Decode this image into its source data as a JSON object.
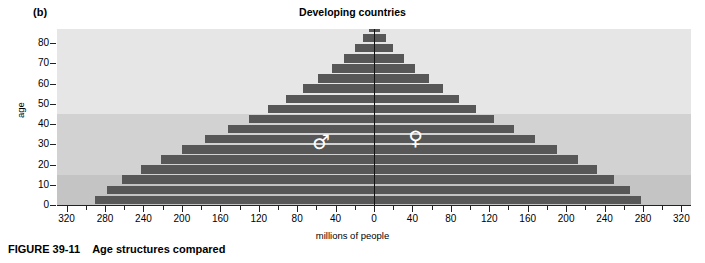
{
  "panel": {
    "label": "(b)"
  },
  "caption": {
    "figure_number": "FIGURE 39-11",
    "text": "Age structures compared"
  },
  "colors": {
    "bar": "#575757",
    "band_top": "#e6e6e6",
    "band_mid": "#d2d2d2",
    "band_bottom": "#c4c4c4",
    "axis": "#111111",
    "glyph": "#ffffff"
  },
  "glyphs": {
    "male": {
      "name": "male-symbol",
      "char": "♂",
      "label": "male"
    },
    "female": {
      "name": "female-symbol",
      "char": "♀",
      "label": "female"
    }
  },
  "chart_data": {
    "type": "bar",
    "subtype": "population-pyramid",
    "title": "Developing countries",
    "xlabel": "millions of people",
    "ylabel": "age",
    "grid": false,
    "legend": null,
    "x_tick_labels": [
      "320",
      "280",
      "240",
      "200",
      "160",
      "120",
      "80",
      "40",
      "0",
      "40",
      "80",
      "120",
      "160",
      "200",
      "240",
      "280",
      "320"
    ],
    "x_major_step": 40,
    "x_minor_step": 20,
    "xlim": [
      -330,
      330
    ],
    "y_tick_labels": [
      "0",
      "10",
      "20",
      "30",
      "40",
      "50",
      "60",
      "70",
      "80"
    ],
    "y_major_step": 10,
    "ylim": [
      0,
      87
    ],
    "cohort_width": 5,
    "categories": [
      "0-4",
      "5-9",
      "10-14",
      "15-19",
      "20-24",
      "25-29",
      "30-34",
      "35-39",
      "40-44",
      "45-49",
      "50-54",
      "55-59",
      "60-64",
      "65-69",
      "70-74",
      "75-79",
      "80-84",
      "85+"
    ],
    "series": [
      {
        "name": "male",
        "side": "left",
        "values": [
          290,
          278,
          262,
          243,
          222,
          200,
          176,
          152,
          130,
          110,
          92,
          74,
          58,
          44,
          31,
          20,
          11,
          5
        ]
      },
      {
        "name": "female",
        "side": "right",
        "values": [
          278,
          266,
          250,
          232,
          212,
          191,
          168,
          146,
          125,
          106,
          89,
          72,
          57,
          43,
          31,
          20,
          12,
          6
        ]
      }
    ],
    "background_bands": [
      {
        "name": "youth",
        "from": 0,
        "to": 15,
        "color": "#c4c4c4"
      },
      {
        "name": "working",
        "from": 15,
        "to": 45,
        "color": "#d2d2d2"
      },
      {
        "name": "older",
        "from": 45,
        "to": 87,
        "color": "#e6e6e6"
      }
    ],
    "annotations": [
      {
        "name": "male-symbol",
        "text": "♂",
        "x": -55,
        "y": 30
      },
      {
        "name": "female-symbol",
        "text": "♀",
        "x": 45,
        "y": 32
      }
    ]
  }
}
